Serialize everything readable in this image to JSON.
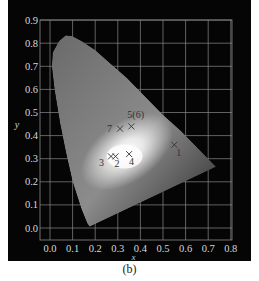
{
  "caption": "(b)",
  "chart_data": {
    "type": "scatter",
    "xlabel": "x",
    "ylabel": "y",
    "xlim": [
      0.0,
      0.8
    ],
    "ylim": [
      0.0,
      0.9
    ],
    "xticks": [
      "0.0",
      "0.1",
      "0.2",
      "0.3",
      "0.4",
      "0.5",
      "0.6",
      "0.7",
      "0.8"
    ],
    "yticks": [
      "0.0",
      "0.1",
      "0.2",
      "0.3",
      "0.4",
      "0.5",
      "0.6",
      "0.7",
      "0.8",
      "0.9"
    ],
    "grid": true,
    "background": "#050505",
    "grid_color": "#8a8a8a",
    "points": [
      {
        "label": "1",
        "x": 0.55,
        "y": 0.36
      },
      {
        "label": "2",
        "x": 0.29,
        "y": 0.31
      },
      {
        "label": "3",
        "x": 0.27,
        "y": 0.31
      },
      {
        "label": "4",
        "x": 0.35,
        "y": 0.32
      },
      {
        "label": "5(6)",
        "x": 0.36,
        "y": 0.44
      },
      {
        "label": "7",
        "x": 0.31,
        "y": 0.43
      }
    ]
  }
}
